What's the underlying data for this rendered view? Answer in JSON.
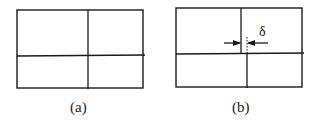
{
  "panels": [
    {
      "id": "a",
      "caption": "(a)",
      "description": "Rectangle divided into four cells by one vertical and one horizontal line (aligned cross)"
    },
    {
      "id": "b",
      "caption": "(b)",
      "description": "Rectangle divided into four cells where the upper and lower vertical lines are offset by a distance delta",
      "dimension_label": "δ",
      "annotation": "two inward-pointing arrows indicating offset between vertical dividers, dotted reference line"
    }
  ],
  "colors": {
    "line": "#1a1a1a",
    "background": "#ffffff"
  }
}
